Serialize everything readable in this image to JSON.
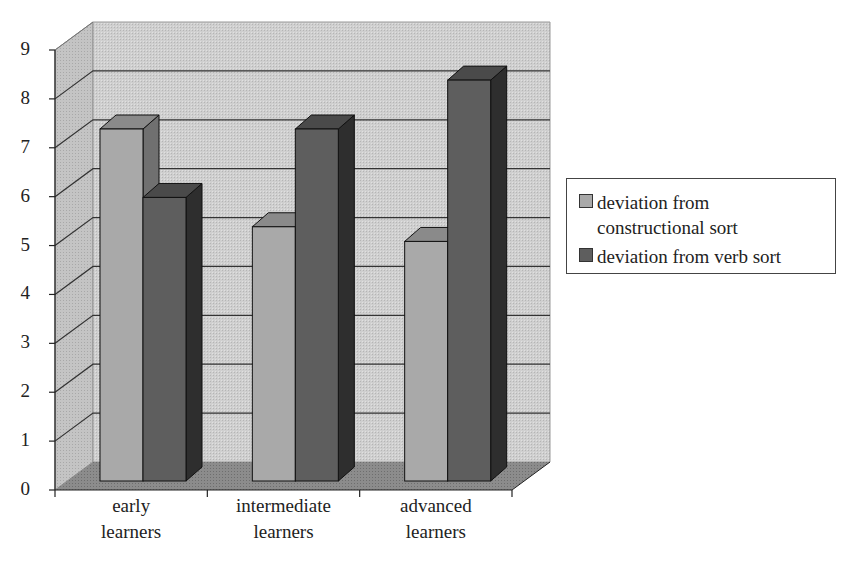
{
  "chart_data": {
    "type": "bar",
    "title": "",
    "xlabel": "",
    "ylabel": "",
    "categories": [
      "early learners",
      "intermediate learners",
      "advanced learners"
    ],
    "category_lines": [
      [
        "early",
        "learners"
      ],
      [
        "intermediate",
        "learners"
      ],
      [
        "advanced",
        "learners"
      ]
    ],
    "series": [
      {
        "name": "deviation from constructional sort",
        "values": [
          7.2,
          5.2,
          4.9
        ],
        "color": "#a9a9a9"
      },
      {
        "name": "deviation from verb sort",
        "values": [
          5.8,
          7.2,
          8.2
        ],
        "color": "#5e5e5e"
      }
    ],
    "ylim": [
      0,
      9
    ],
    "yticks": [
      "0",
      "1",
      "2",
      "3",
      "4",
      "5",
      "6",
      "7",
      "8",
      "9"
    ],
    "grid": true,
    "style": "3d",
    "legend_position": "right"
  },
  "legend": {
    "items": [
      {
        "line1": "deviation from",
        "line2": "constructional sort"
      },
      {
        "line1": "deviation from verb sort"
      }
    ]
  }
}
